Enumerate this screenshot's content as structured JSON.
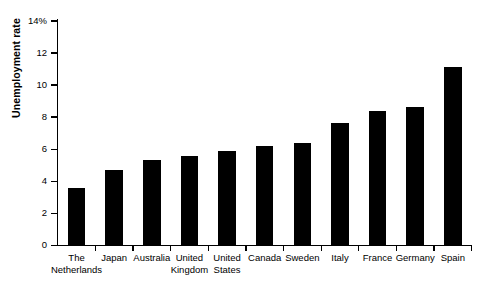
{
  "chart_data": {
    "type": "bar",
    "title": "",
    "xlabel": "",
    "ylabel": "Unemployment rate",
    "ylim": [
      0,
      14
    ],
    "ytick_labels": [
      "0",
      "2",
      "4",
      "6",
      "8",
      "10",
      "12",
      "14%"
    ],
    "ytick_values": [
      0,
      2,
      4,
      6,
      8,
      10,
      12,
      14
    ],
    "grid": false,
    "legend": null,
    "bar_color": "#000000",
    "categories": [
      "The Netherlands",
      "Japan",
      "Australia",
      "United Kingdom",
      "United States",
      "Canada",
      "Sweden",
      "Italy",
      "France",
      "Germany",
      "Spain"
    ],
    "category_lines": [
      [
        "The",
        "Netherlands"
      ],
      [
        "Japan",
        ""
      ],
      [
        "Australia",
        ""
      ],
      [
        "United",
        "Kingdom"
      ],
      [
        "United",
        "States"
      ],
      [
        "Canada",
        ""
      ],
      [
        "Sweden",
        ""
      ],
      [
        "Italy",
        ""
      ],
      [
        "France",
        ""
      ],
      [
        "Germany",
        ""
      ],
      [
        "Spain",
        ""
      ]
    ],
    "values": [
      3.6,
      4.7,
      5.3,
      5.6,
      5.9,
      6.2,
      6.4,
      7.6,
      8.4,
      8.6,
      11.1
    ]
  }
}
